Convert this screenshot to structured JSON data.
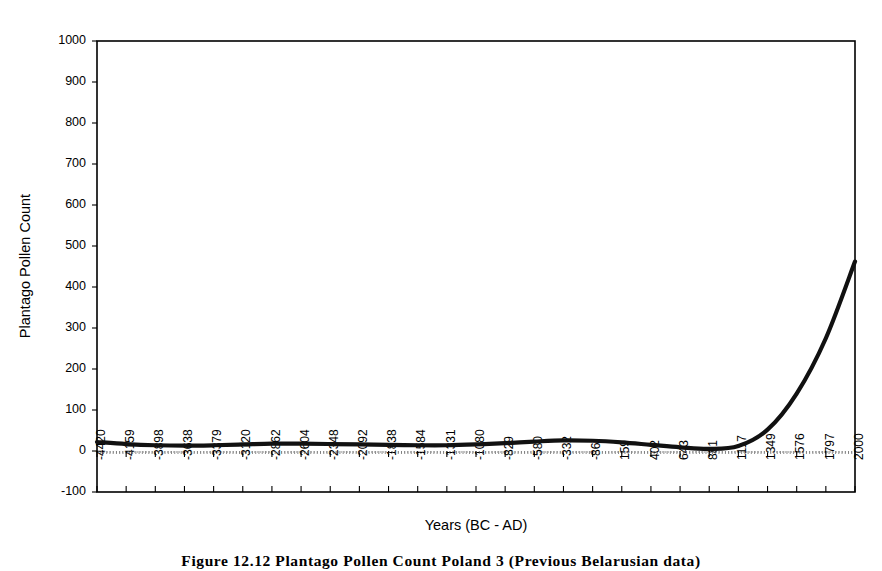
{
  "figure": {
    "caption": "Figure 12.12    Plantago Pollen Count Poland 3 (Previous Belarusian data)"
  },
  "chart_data": {
    "type": "line",
    "title": "",
    "xlabel": "Years (BC - AD)",
    "ylabel": "Plantago Pollen Count",
    "ylim": [
      -100,
      1000
    ],
    "ytick_labels": [
      "1000",
      "900",
      "800",
      "700",
      "600",
      "500",
      "400",
      "300",
      "200",
      "100",
      "0",
      "-100"
    ],
    "ytick_values": [
      1000,
      900,
      800,
      700,
      600,
      500,
      400,
      300,
      200,
      100,
      0,
      -100
    ],
    "grid": false,
    "legend": "none",
    "xtick_labels": [
      "-4420",
      "-4159",
      "-3898",
      "-3638",
      "-3379",
      "-3120",
      "-2862",
      "-2604",
      "-2348",
      "-2092",
      "-1838",
      "-1584",
      "-1331",
      "-1080",
      "-829",
      "-580",
      "-332",
      "-86",
      "159",
      "402",
      "643",
      "881",
      "1117",
      "1349",
      "1576",
      "1797",
      "2000"
    ],
    "x": [
      -4420,
      -4159,
      -3898,
      -3638,
      -3379,
      -3120,
      -2862,
      -2604,
      -2348,
      -2092,
      -1838,
      -1584,
      -1331,
      -1080,
      -829,
      -580,
      -332,
      -86,
      159,
      402,
      643,
      881,
      1117,
      1349,
      1576,
      1797,
      2000
    ],
    "series": [
      {
        "name": "Plantago Pollen Count",
        "values": [
          22,
          17,
          14,
          13,
          14,
          16,
          18,
          18,
          17,
          16,
          15,
          14,
          14,
          16,
          19,
          23,
          26,
          25,
          21,
          15,
          9,
          5,
          12,
          52,
          140,
          275,
          462
        ]
      }
    ]
  }
}
